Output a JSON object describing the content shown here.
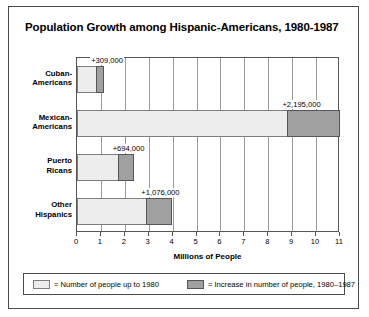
{
  "chart_data": {
    "type": "bar",
    "orientation": "horizontal",
    "stacked": true,
    "title": "Population Growth among Hispanic-Americans, 1980-1987",
    "xlabel": "Millions of People",
    "ylabel": "",
    "xlim": [
      0,
      11
    ],
    "xticks": [
      "0",
      "1",
      "2",
      "3",
      "4",
      "5",
      "6",
      "7",
      "8",
      "9",
      "10",
      "11"
    ],
    "grid": true,
    "legend_position": "bottom",
    "categories": [
      "Cuban-\nAmericans",
      "Mexican-\nAmericans",
      "Puerto\nRicans",
      "Other\nHispanics"
    ],
    "series": [
      {
        "name": "= Number of people up to 1980",
        "key": "base",
        "color": "#ededed",
        "values": [
          0.8,
          8.8,
          1.7,
          2.9
        ]
      },
      {
        "name": "= Increase in number of people, 1980–1987",
        "key": "increase",
        "color": "#a0a0a0",
        "values": [
          0.309,
          2.195,
          0.694,
          1.076
        ]
      }
    ],
    "data_labels": [
      "+309,000",
      "+2,195,000",
      "+694,000",
      "+1,076,000"
    ],
    "annotations": []
  },
  "chart": {
    "title": "Population Growth among Hispanic-Americans, 1980-1987",
    "axis_title": "Millions of People",
    "rows": [
      {
        "label_line1": "Cuban-",
        "label_line2": "Americans",
        "base": 0.8,
        "increase": 0.309,
        "data_label": "+309,000"
      },
      {
        "label_line1": "Mexican-",
        "label_line2": "Americans",
        "base": 8.8,
        "increase": 2.195,
        "data_label": "+2,195,000"
      },
      {
        "label_line1": "Puerto",
        "label_line2": "Ricans",
        "base": 1.7,
        "increase": 0.694,
        "data_label": "+694,000"
      },
      {
        "label_line1": "Other",
        "label_line2": "Hispanics",
        "base": 2.9,
        "increase": 1.076,
        "data_label": "+1,076,000"
      }
    ],
    "xticks": [
      "0",
      "1",
      "2",
      "3",
      "4",
      "5",
      "6",
      "7",
      "8",
      "9",
      "10",
      "11"
    ],
    "legend": [
      {
        "text": "= Number of people up to 1980",
        "color": "#ededed"
      },
      {
        "text": "= Increase in number of people, 1980–1987",
        "color": "#a0a0a0"
      }
    ]
  }
}
